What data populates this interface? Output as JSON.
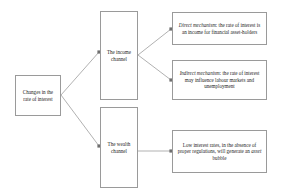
{
  "diagram": {
    "type": "flowchart",
    "background_color": "#ffffff",
    "border_color": "#9a9a9a",
    "edge_color": "#8f8f8f",
    "text_color": "#1d1d1d",
    "nodes": {
      "source": {
        "id": "source",
        "label": "Changes in the rate of interest"
      },
      "income_channel": {
        "id": "income-channel",
        "label": "The income channel"
      },
      "wealth_channel": {
        "id": "wealth-channel",
        "label": "The wealth channel"
      },
      "direct_mechanism": {
        "id": "direct-mechanism",
        "term": "Direct mechanism",
        "label": ": the rate of interest is an income for financial asset-holders",
        "full_text": "Direct mechanism: the rate of interest is an income for financial asset-holders"
      },
      "indirect_mechanism": {
        "id": "indirect-mechanism",
        "term": "Indirect mechanism",
        "label": ": the rate of interest may influence labour markets and unemployment",
        "full_text": "Indirect mechanism: the rate of interest may influence labour markets and unemployment"
      },
      "asset_bubble": {
        "id": "asset-bubble",
        "label_part1": "Low interest rates, in the absence of proper regulations, will generate an ",
        "term": "asset",
        "label_part2": " bubble",
        "full_text": "Low interest rates, in the absence of proper regulations, will generate an asset bubble"
      }
    },
    "edges": [
      {
        "id": "source-to-income",
        "from": "source",
        "to": "income_channel",
        "style": "solid-arrow"
      },
      {
        "id": "source-to-wealth",
        "from": "source",
        "to": "wealth_channel",
        "style": "solid-arrow"
      },
      {
        "id": "income-to-direct",
        "from": "income_channel",
        "to": "direct_mechanism",
        "style": "solid-arrow"
      },
      {
        "id": "income-to-indirect",
        "from": "income_channel",
        "to": "indirect_mechanism",
        "style": "solid-arrow"
      },
      {
        "id": "wealth-to-bubble",
        "from": "wealth_channel",
        "to": "asset_bubble",
        "style": "solid-arrow"
      }
    ]
  }
}
